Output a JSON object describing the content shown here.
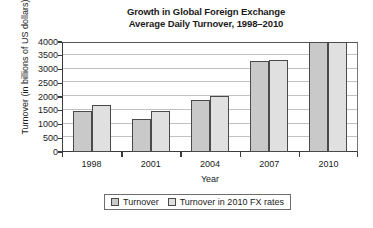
{
  "chart_data": {
    "type": "bar",
    "title": "Growth in Global Foreign Exchange Average Daily Turnover, 1998–2010",
    "title_lines": [
      "Growth in Global Foreign Exchange",
      "Average Daily Turnover, 1998–2010"
    ],
    "xlabel": "Year",
    "ylabel": "Turnover (in billions of US dollars)",
    "categories": [
      "1998",
      "2001",
      "2004",
      "2007",
      "2010"
    ],
    "ylim": [
      0,
      4000
    ],
    "yticks": [
      0,
      500,
      1000,
      1500,
      2000,
      2500,
      3000,
      3500,
      4000
    ],
    "ytick_labels": [
      "0",
      "500",
      "1000",
      "1500",
      "2000",
      "2500",
      "3000",
      "3500",
      "4000"
    ],
    "grid": true,
    "legend_position": "bottom",
    "series": [
      {
        "name": "Turnover",
        "color": "#c9c9c9",
        "values": [
          1500,
          1200,
          1900,
          3300,
          4000
        ]
      },
      {
        "name": "Turnover in 2010 FX rates",
        "color": "#e0e0e0",
        "values": [
          1700,
          1500,
          2050,
          3350,
          4000
        ]
      }
    ]
  },
  "legend": {
    "entries": [
      {
        "label": "Turnover"
      },
      {
        "label": "Turnover in 2010 FX rates"
      }
    ]
  },
  "colors": {
    "series_1": "#c9c9c9",
    "series_2": "#e0e0e0",
    "axis": "#3b3b3b",
    "gridline": "#c2c2c2",
    "background": "#ffffff"
  }
}
